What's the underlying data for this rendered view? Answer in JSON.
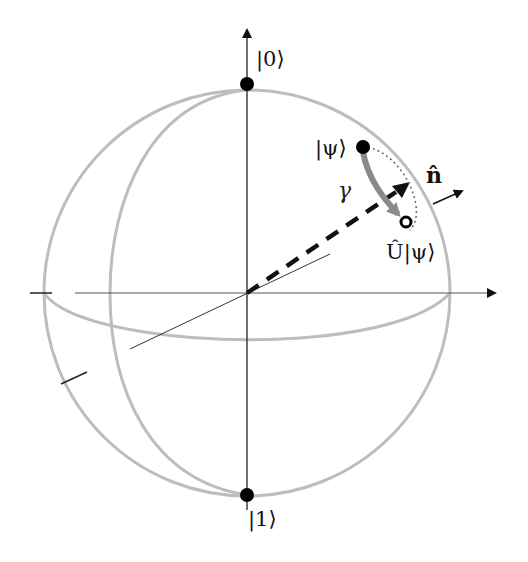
{
  "diagram": {
    "labels": {
      "ket0": "|0⟩",
      "ket1": "|1⟩",
      "psi": "|ψ⟩",
      "u_psi": "Û|ψ⟩",
      "n_hat": "n̂",
      "gamma": "γ"
    },
    "colors": {
      "sphere": "#bdbdbd",
      "axes": "#222222",
      "rotation_arrow": "#8a8a8a",
      "points": "#000000"
    },
    "geometry": {
      "center": [
        247,
        293
      ],
      "radius": 203,
      "north_pole": [
        247,
        84
      ],
      "south_pole": [
        247,
        495
      ],
      "psi_point": [
        363,
        147
      ],
      "u_psi_point": [
        406,
        222
      ]
    }
  }
}
